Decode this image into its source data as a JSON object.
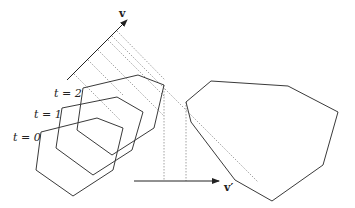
{
  "diagram": {
    "vector_labels": {
      "v": "v",
      "v_prime": "v′"
    },
    "time_labels": [
      "t = 0",
      "t = 1",
      "t = 2"
    ]
  }
}
